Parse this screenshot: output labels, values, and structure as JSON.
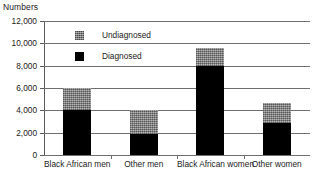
{
  "chart_data": {
    "type": "bar",
    "subtype": "stacked-vertical",
    "title": "",
    "ylabel": "Numbers",
    "xlabel": "",
    "ylim": [
      0,
      12000
    ],
    "ytick_labels": [
      "12,000",
      "10,000",
      "8,000",
      "6,000",
      "4,000",
      "2,000",
      "0"
    ],
    "ytick_values": [
      12000,
      10000,
      8000,
      6000,
      4000,
      2000,
      0
    ],
    "grid": true,
    "legend_position": "inside-top-center",
    "categories": [
      "Black African men",
      "Other men",
      "Black African women",
      "Other women"
    ],
    "series": [
      {
        "name": "Diagnosed",
        "color": "#000000",
        "fill": "solid-black",
        "values": [
          4000,
          1900,
          8000,
          2900
        ]
      },
      {
        "name": "Undiagnosed",
        "color": "#8d8d8d",
        "fill": "gray-crosshatch-texture",
        "values": [
          2000,
          2100,
          1600,
          1800
        ]
      }
    ],
    "totals": [
      6000,
      4000,
      9600,
      4700
    ]
  },
  "legend": {
    "items": [
      {
        "label": "Undiagnosed",
        "swatch": "gray-texture-swatch"
      },
      {
        "label": "Diagnosed",
        "swatch": "black-swatch"
      }
    ]
  }
}
